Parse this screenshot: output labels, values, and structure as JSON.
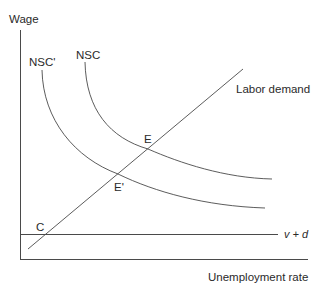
{
  "diagram": {
    "type": "economics-diagram",
    "colors": {
      "line": "#4a4a4a",
      "text": "#2a2a2a",
      "background": "#ffffff"
    },
    "axes": {
      "y_label": "Wage",
      "x_label": "Unemployment rate"
    },
    "curves": {
      "nsc": {
        "label": "NSC"
      },
      "nsc_prime": {
        "label": "NSC'"
      },
      "labor_demand": {
        "label": "Labor demand"
      },
      "v_plus_d": {
        "label": "v + d"
      }
    },
    "points": {
      "e": {
        "label": "E"
      },
      "e_prime": {
        "label": "E'"
      },
      "c": {
        "label": "C"
      }
    }
  }
}
